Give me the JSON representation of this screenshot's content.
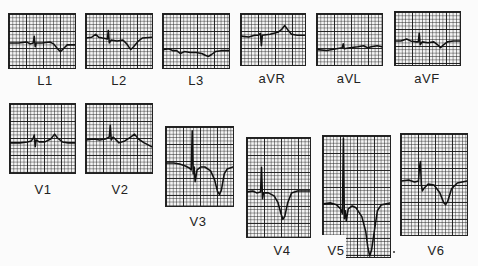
{
  "figure": {
    "leads": [
      {
        "id": "L1",
        "label": "L1"
      },
      {
        "id": "L2",
        "label": "L2"
      },
      {
        "id": "L3",
        "label": "L3"
      },
      {
        "id": "aVR",
        "label": "aVR"
      },
      {
        "id": "aVL",
        "label": "aVL"
      },
      {
        "id": "aVF",
        "label": "aVF"
      },
      {
        "id": "V1",
        "label": "V1"
      },
      {
        "id": "V2",
        "label": "V2"
      },
      {
        "id": "V3",
        "label": "V3"
      },
      {
        "id": "V4",
        "label": "V4"
      },
      {
        "id": "V5",
        "label": "V5"
      },
      {
        "id": "V6",
        "label": "V6"
      }
    ]
  },
  "colors": {
    "background": "#fbfbfb",
    "grid_paper": "#f4f4f4",
    "trace": "#111111"
  }
}
